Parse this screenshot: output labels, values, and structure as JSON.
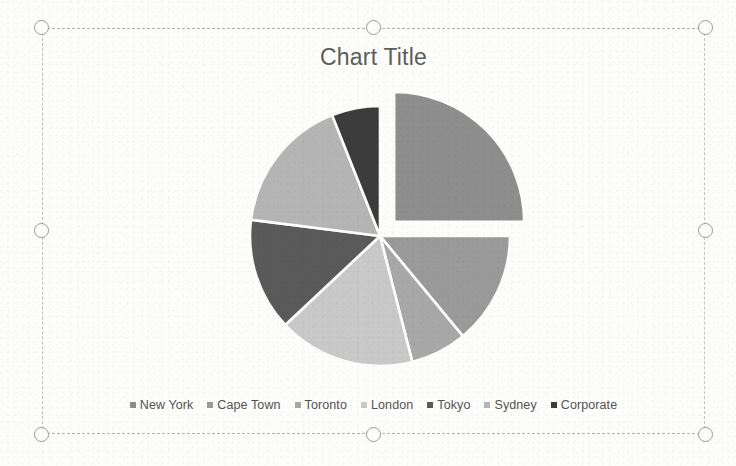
{
  "chart_data": {
    "type": "pie",
    "title": "Chart Title",
    "categories": [
      "New York",
      "Cape Town",
      "Toronto",
      "London",
      "Tokyo",
      "Sydney",
      "Corporate"
    ],
    "values": [
      25,
      14,
      7,
      17,
      14,
      17,
      6
    ],
    "colors": [
      "#8e8e8e",
      "#9a9a9a",
      "#a8a8a8",
      "#c9c9c9",
      "#5a5a5a",
      "#b5b5b5",
      "#3c3c3c"
    ],
    "exploded": [
      "New York"
    ],
    "legend_position": "bottom",
    "grid": false,
    "start_angle": 0,
    "xlabel": "",
    "ylabel": ""
  },
  "legend": {
    "items": [
      {
        "label": "New York",
        "color": "#8e8e8e"
      },
      {
        "label": "Cape Town",
        "color": "#9a9a9a"
      },
      {
        "label": "Toronto",
        "color": "#a8a8a8"
      },
      {
        "label": "London",
        "color": "#c9c9c9"
      },
      {
        "label": "Tokyo",
        "color": "#5a5a5a"
      },
      {
        "label": "Sydney",
        "color": "#b5b5b5"
      },
      {
        "label": "Corporate",
        "color": "#3c3c3c"
      }
    ]
  },
  "selection": {
    "handle_count": 8,
    "handles": [
      "top-left",
      "top-center",
      "top-right",
      "middle-left",
      "middle-right",
      "bottom-left",
      "bottom-center",
      "bottom-right"
    ]
  }
}
